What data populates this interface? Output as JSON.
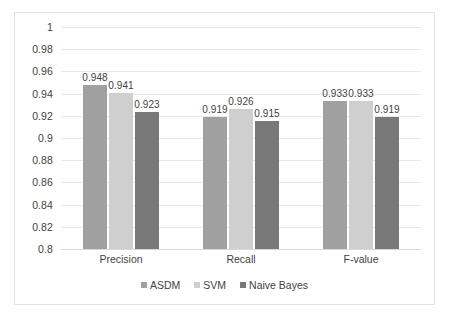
{
  "chart_data": {
    "type": "bar",
    "title": "",
    "subtitle": "",
    "xlabel": "",
    "ylabel": "",
    "categories": [
      "Precision",
      "Recall",
      "F-value"
    ],
    "series": [
      {
        "name": "ASDM",
        "color": "#a0a0a0",
        "values": [
          0.948,
          0.919,
          0.933
        ]
      },
      {
        "name": "SVM",
        "color": "#cfcfcf",
        "values": [
          0.941,
          0.926,
          0.933
        ]
      },
      {
        "name": "Naive Bayes",
        "color": "#787878",
        "values": [
          0.923,
          0.915,
          0.919
        ]
      }
    ],
    "value_labels": [
      [
        "0.948",
        "0.941",
        "0.923"
      ],
      [
        "0.919",
        "0.926",
        "0.915"
      ],
      [
        "0.933",
        "0.933",
        "0.919"
      ]
    ],
    "ylim": [
      0.8,
      1
    ],
    "ytick_values": [
      0.8,
      0.82,
      0.84,
      0.86,
      0.88,
      0.9,
      0.92,
      0.94,
      0.96,
      0.98,
      1
    ],
    "ytick_labels": [
      "0.8",
      "0.82",
      "0.84",
      "0.86",
      "0.88",
      "0.9",
      "0.92",
      "0.94",
      "0.96",
      "0.98",
      "1"
    ],
    "grid": true,
    "grid_axis": "y",
    "legend_position": "bottom",
    "legend_marker": "square",
    "background_color": "#ffffff",
    "border_color": "#e3e3e3",
    "gridline_color": "#e8e8e8",
    "text_color": "#3f3f3f"
  }
}
